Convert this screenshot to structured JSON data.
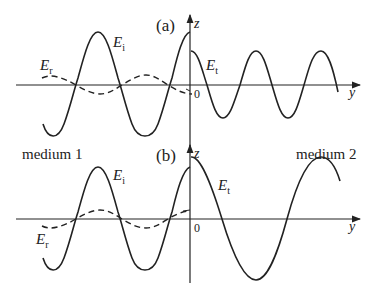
{
  "panels": [
    {
      "id": "a",
      "label": "(a)",
      "axis_z_label": "z",
      "axis_y_label": "y",
      "origin_label": "0",
      "waves": {
        "incident": {
          "symbol": "E",
          "subscript": "i",
          "style": "solid"
        },
        "reflected": {
          "symbol": "E",
          "subscript": "r",
          "style": "dashed"
        },
        "transmitted": {
          "symbol": "E",
          "subscript": "t",
          "style": "solid"
        }
      }
    },
    {
      "id": "b",
      "label": "(b)",
      "axis_z_label": "z",
      "axis_y_label": "y",
      "origin_label": "0",
      "waves": {
        "incident": {
          "symbol": "E",
          "subscript": "i",
          "style": "solid"
        },
        "reflected": {
          "symbol": "E",
          "subscript": "r",
          "style": "dashed"
        },
        "transmitted": {
          "symbol": "E",
          "subscript": "t",
          "style": "solid"
        }
      }
    }
  ],
  "media": {
    "left": "medium 1",
    "right": "medium 2"
  },
  "colors": {
    "line": "#222222",
    "background": "#ffffff"
  }
}
